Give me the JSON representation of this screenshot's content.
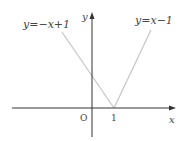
{
  "figure": {
    "type": "function-graph",
    "lines": [
      {
        "label": "y=−x+1",
        "color": "#c8c8c8"
      },
      {
        "label": "y=x−1",
        "color": "#c8c8c8"
      }
    ],
    "axes": {
      "x_label": "x",
      "y_label": "y",
      "origin_label": "O",
      "tick_label": "1"
    },
    "axis_color": "#333333"
  }
}
